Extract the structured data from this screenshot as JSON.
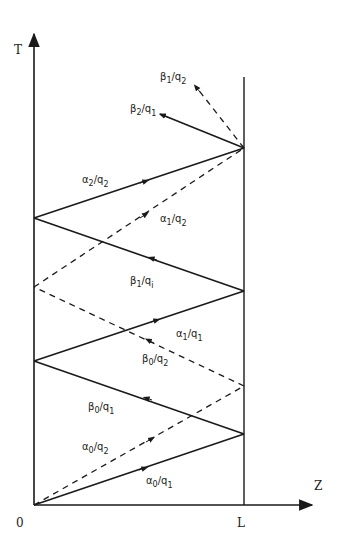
{
  "axes": {
    "t_label": "T",
    "z_label": "Z",
    "origin_label": "0",
    "l_label": "L"
  },
  "colors": {
    "ink": "#1a1a1a",
    "background": "#ffffff"
  },
  "labels": {
    "alpha0_q1": {
      "sym": "α",
      "sub1": "0",
      "slash": "/q",
      "sub2": "1"
    },
    "alpha0_q2": {
      "sym": "α",
      "sub1": "0",
      "slash": "/q",
      "sub2": "2"
    },
    "beta0_q1": {
      "sym": "β",
      "sub1": "0",
      "slash": "/q",
      "sub2": "1"
    },
    "beta0_q2": {
      "sym": "β",
      "sub1": "0",
      "slash": "/q",
      "sub2": "2"
    },
    "alpha1_q1": {
      "sym": "α",
      "sub1": "1",
      "slash": "/q",
      "sub2": "1"
    },
    "beta1_qi": {
      "sym": "β",
      "sub1": "1",
      "slash": "/q",
      "sub2": "i"
    },
    "alpha1_q2": {
      "sym": "α",
      "sub1": "1",
      "slash": "/q",
      "sub2": "2"
    },
    "alpha2_q2": {
      "sym": "α",
      "sub1": "2",
      "slash": "/q",
      "sub2": "2"
    },
    "beta2_q1": {
      "sym": "β",
      "sub1": "2",
      "slash": "/q",
      "sub2": "1"
    },
    "beta1_q2": {
      "sym": "β",
      "sub1": "1",
      "slash": "/q",
      "sub2": "2"
    }
  }
}
